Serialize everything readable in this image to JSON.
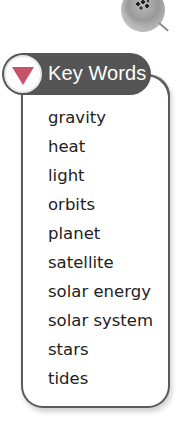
{
  "decoration": {
    "icon": "planet-icon"
  },
  "key_words": {
    "title": "Key Words",
    "header_icon": "triangle-down-icon",
    "colors": {
      "header_bg": "#555555",
      "triangle": "#c7526a",
      "border": "#5a5a5a"
    },
    "words": [
      "gravity",
      "heat",
      "light",
      "orbits",
      "planet",
      "satellite",
      "solar energy",
      "solar system",
      "stars",
      "tides"
    ]
  }
}
